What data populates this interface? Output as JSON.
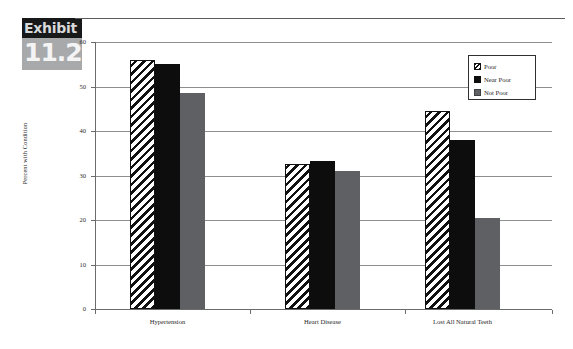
{
  "exhibit": {
    "word": "Exhibit",
    "number": "11.2"
  },
  "chart_data": {
    "type": "bar",
    "title": "",
    "xlabel": "",
    "ylabel": "Percent with Condition",
    "categories": [
      "Hypertension",
      "Heart Disease",
      "Lost All Natural Teeth"
    ],
    "series": [
      {
        "name": "Poor",
        "values": [
          56.0,
          32.5,
          44.5
        ],
        "fill": "hatch-diagonal",
        "color": "#111111"
      },
      {
        "name": "Near Poor",
        "values": [
          55.0,
          33.3,
          38.0
        ],
        "fill": "solid",
        "color": "#0d0d0d"
      },
      {
        "name": "Not Poor",
        "values": [
          48.5,
          31.0,
          20.5
        ],
        "fill": "solid",
        "color": "#5f6063"
      }
    ],
    "ylim": [
      0,
      60
    ],
    "yticks": [
      0,
      10,
      20,
      30,
      40,
      50,
      60
    ],
    "ytick_labels": [
      "0",
      "10",
      "20",
      "30",
      "40",
      "50",
      "60"
    ],
    "grid": true,
    "grid_axis": "y",
    "legend_position": "top-right"
  },
  "legend": {
    "entries": [
      {
        "label": "Poor",
        "swatch": "hatch-swatch"
      },
      {
        "label": "Near Poor",
        "swatch": "black-swatch"
      },
      {
        "label": "Not Poor",
        "swatch": "gray-swatch"
      }
    ]
  }
}
